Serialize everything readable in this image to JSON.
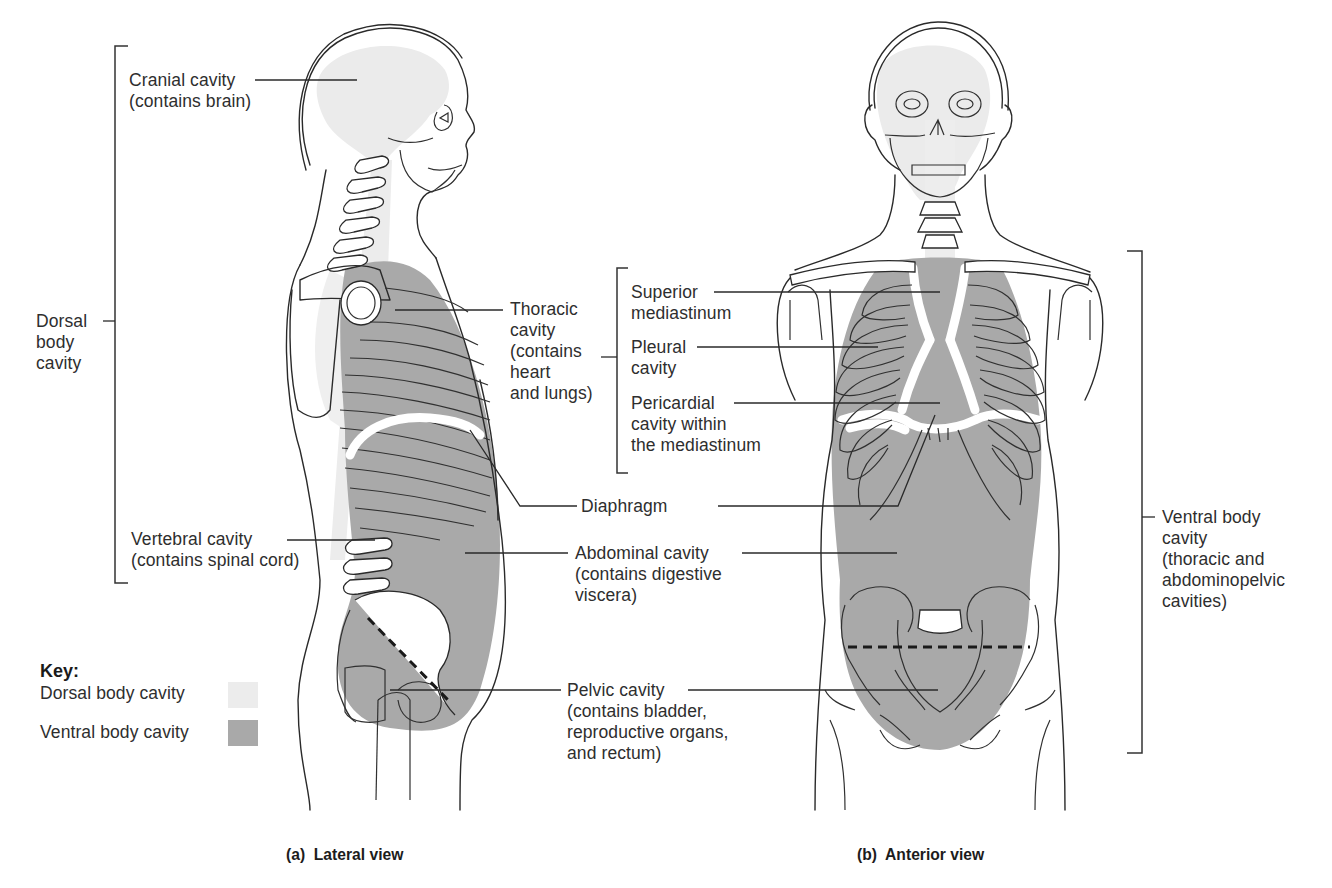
{
  "colors": {
    "dorsal_cavity": "#ebebeb",
    "ventral_cavity": "#a9a9a9",
    "outline": "#2a2a2a",
    "text": "#2e2e2e",
    "background": "#ffffff"
  },
  "lateral_view": {
    "caption": "(a)  Lateral view",
    "labels": {
      "cranial_cavity": "Cranial cavity\n(contains brain)",
      "dorsal_body_cavity": "Dorsal\nbody\ncavity",
      "vertebral_cavity": "Vertebral cavity\n(contains spinal cord)",
      "thoracic_cavity": "Thoracic\ncavity\n(contains\nheart\nand lungs)",
      "diaphragm": "Diaphragm",
      "abdominal_cavity": "Abdominal cavity\n(contains digestive\nviscera)",
      "pelvic_cavity": "Pelvic cavity\n(contains bladder,\nreproductive organs,\nand rectum)"
    }
  },
  "anterior_view": {
    "caption": "(b)  Anterior view",
    "labels": {
      "superior_mediastinum": "Superior\nmediastinum",
      "pleural_cavity": "Pleural\ncavity",
      "pericardial_cavity": "Pericardial\ncavity within\nthe mediastinum",
      "ventral_body_cavity": "Ventral body\ncavity\n(thoracic and\nabdominopelvic\ncavities)"
    }
  },
  "key": {
    "title": "Key:",
    "items": [
      {
        "label": "Dorsal body cavity",
        "swatch": "dorsal"
      },
      {
        "label": "Ventral body cavity",
        "swatch": "ventral"
      }
    ]
  }
}
